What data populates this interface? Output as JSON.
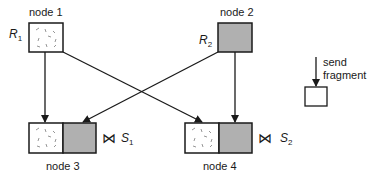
{
  "colors": {
    "stroke": "#1a1a1a",
    "remote_fill": "#b0b0b0",
    "local_fill": "#ffffff",
    "speckle": "#8a8a8a"
  },
  "nodes": [
    {
      "id": "node1",
      "label": "node 1",
      "relation": "R",
      "relation_sub": "1"
    },
    {
      "id": "node2",
      "label": "node 2",
      "relation": "R",
      "relation_sub": "2"
    },
    {
      "id": "node3",
      "label": "node 3",
      "result": "S",
      "result_sub": "1"
    },
    {
      "id": "node4",
      "label": "node 4",
      "result": "S",
      "result_sub": "2"
    }
  ],
  "legend": {
    "line1": "send",
    "line2": "fragment"
  },
  "symbols": {
    "join": "⋈"
  }
}
